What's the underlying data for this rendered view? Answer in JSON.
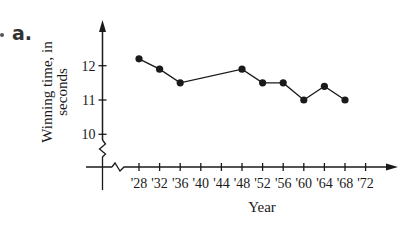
{
  "problem": {
    "label": "a."
  },
  "chart_data": {
    "type": "line",
    "title": "",
    "xlabel": "Year",
    "ylabel": "Winning time, in seconds",
    "ylabel_lines": [
      "Winning time, in",
      "seconds"
    ],
    "x_tick_labels": [
      "'28",
      "'32",
      "'36",
      "'40",
      "'44",
      "'48",
      "'52",
      "'56",
      "'60",
      "'64",
      "'68",
      "'72"
    ],
    "y_tick_labels": [
      "10",
      "11",
      "12"
    ],
    "y_ticks": [
      10,
      11,
      12
    ],
    "x": [
      "'28",
      "'32",
      "'36",
      "'48",
      "'52",
      "'56",
      "'60",
      "'64",
      "'68"
    ],
    "values": [
      12.2,
      11.9,
      11.5,
      11.9,
      11.5,
      11.5,
      11.0,
      11.4,
      11.0
    ],
    "axis_breaks": [
      "x",
      "y"
    ],
    "grid": false,
    "legend": null,
    "markers": "filled-circle",
    "line_color": "#1a1a1a"
  }
}
